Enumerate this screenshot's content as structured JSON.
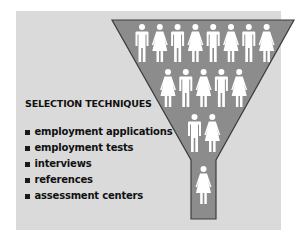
{
  "diagram": {
    "title": "SELECTION TECHNIQUES",
    "techniques": [
      "employment applications",
      "employment tests",
      "interviews",
      "references",
      "assessment centers"
    ],
    "funnel": {
      "rows": [
        [
          "male",
          "female",
          "male",
          "female",
          "male",
          "female",
          "male",
          "female"
        ],
        [
          "female",
          "male",
          "female",
          "male",
          "female"
        ],
        [
          "male",
          "female"
        ],
        [
          "female"
        ]
      ]
    },
    "colors": {
      "panel_bg": "#dadada",
      "funnel_fill": "#8c8c8c",
      "funnel_outline": "#3c3c3c",
      "figure": "#ffffff",
      "text": "#111111"
    }
  }
}
